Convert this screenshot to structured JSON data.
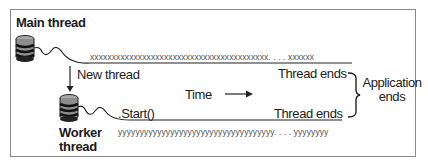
{
  "diagram": {
    "main_thread": {
      "title": "Main thread",
      "sequence": "xxxxxxxxxxxxxxxxxxxxxxxxxxxxxxxxxxxxxxxxx. . . . xxxxxx",
      "end_label": "Thread ends"
    },
    "new_thread_label": "New thread",
    "worker_thread": {
      "title_line1": "Worker",
      "title_line2": "thread",
      "start_label": ".Start()",
      "sequence": "yyyyyyyyyyyyyyyyyyyyyyyyyyyyyyyyyyyy. . . . yyyyyyyy",
      "end_label": "Thread ends"
    },
    "time_label": "Time",
    "application_ends": {
      "line1": "Application",
      "line2": "ends"
    },
    "colors": {
      "border": "#8a8a8a",
      "line": "#222222",
      "spool_fill": "#9a9a9a",
      "spool_band": "#222222"
    }
  }
}
